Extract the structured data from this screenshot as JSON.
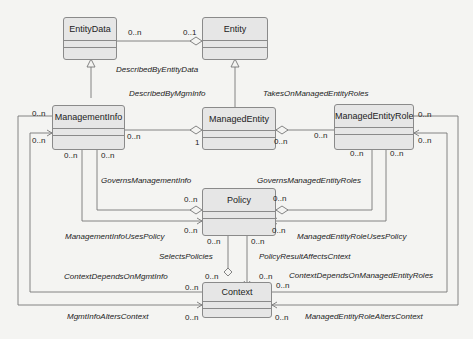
{
  "classes": {
    "entitydata": {
      "name": "EntityData"
    },
    "entity": {
      "name": "Entity"
    },
    "managementinfo": {
      "name": "ManagementInfo"
    },
    "managedentity": {
      "name": "ManagedEntity"
    },
    "managedentityrole": {
      "name": "ManagedEntityRole"
    },
    "policy": {
      "name": "Policy"
    },
    "context": {
      "name": "Context"
    }
  },
  "associations": {
    "described_by_entity_data": "DescribedByEntityData",
    "described_by_mgm_info": "DescribedByMgmInfo",
    "takes_on_managed_entity_roles": "TakesOnManagedEntityRoles",
    "governs_management_info": "GovernsManagementInfo",
    "governs_managed_entity_roles": "GovernsManagedEntityRoles",
    "management_info_uses_policy": "ManagementInfoUsesPolicy",
    "managed_entity_role_uses_policy": "ManagedEntityRoleUsesPolicy",
    "selects_policies": "SelectsPolicies",
    "policy_result_affects_cntext": "PolicyResultAffectsCntext",
    "context_depends_on_mgmt_info": "ContextDependsOnMgmtInfo",
    "context_depends_on_managed_entity_roles": "ContextDependsOnManagedEntityRoles",
    "mgmt_info_alters_context": "MgmtInfoAltersContext",
    "managed_entity_role_alters_context": "ManagedEntityRoleAltersContext"
  },
  "multiplicities": {
    "many": "0..n",
    "optional_one": "0..1",
    "one": "1"
  }
}
